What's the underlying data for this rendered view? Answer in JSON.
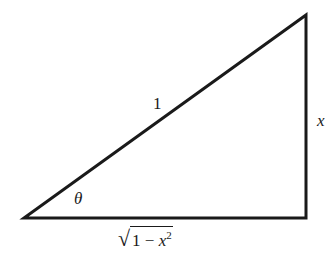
{
  "diagram": {
    "type": "right-triangle",
    "stroke_color": "#1a1a1a",
    "vertices": {
      "bottom_left": [
        24,
        218
      ],
      "bottom_right": [
        306,
        218
      ],
      "top_right": [
        306,
        15
      ]
    },
    "labels": {
      "hypotenuse": "1",
      "opposite": "x",
      "angle": "θ",
      "adjacent_radicand_prefix": "1 − ",
      "adjacent_var": "x",
      "adjacent_exp": "2",
      "adjacent_root": "√"
    }
  }
}
